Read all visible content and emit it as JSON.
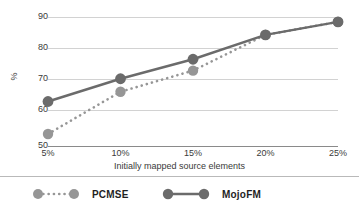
{
  "chart_data": {
    "type": "line",
    "title": "",
    "xlabel": "Initially mapped source elements",
    "ylabel": "%",
    "categories": [
      "5%",
      "10%",
      "15%",
      "20%",
      "25%"
    ],
    "yticks": [
      "50",
      "60",
      "70",
      "80",
      "90"
    ],
    "ylim": [
      50,
      90
    ],
    "grid": true,
    "legend_position": "bottom",
    "series": [
      {
        "name": "PCMSE",
        "values": [
          54,
          67,
          73.5,
          84.5,
          88.5
        ],
        "color": "#969696",
        "line_style": "dotted",
        "marker": "circle"
      },
      {
        "name": "MojoFM",
        "values": [
          64,
          71,
          77,
          84.5,
          88.5
        ],
        "color": "#6b6b6b",
        "line_style": "solid",
        "marker": "circle"
      }
    ]
  },
  "axes": {
    "y_label": "%",
    "y_ticks": [
      "50",
      "60",
      "70",
      "80",
      "90"
    ],
    "x_ticks": [
      "5%",
      "10%",
      "15%",
      "20%",
      "25%"
    ],
    "x_title": "Initially mapped source elements"
  },
  "legend": {
    "items": [
      {
        "label": "PCMSE",
        "color": "#969696",
        "style": "dotted"
      },
      {
        "label": "MojoFM",
        "color": "#6b6b6b",
        "style": "solid"
      }
    ]
  },
  "colors": {
    "pcmse": "#969696",
    "mojofm": "#6b6b6b",
    "gridline": "#d2d2d2",
    "axis": "#8a8a8a",
    "text": "#3a3a3a"
  }
}
